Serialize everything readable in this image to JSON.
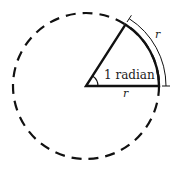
{
  "diagram": {
    "title": "1 radian",
    "labels": {
      "angle": "1 radian",
      "radius": "r",
      "arc_length": "r"
    },
    "colors": {
      "stroke": "#111111",
      "background": "#ffffff"
    },
    "geometry": {
      "center": [
        86,
        86
      ],
      "radius": 73,
      "angle_rad": 1
    }
  }
}
